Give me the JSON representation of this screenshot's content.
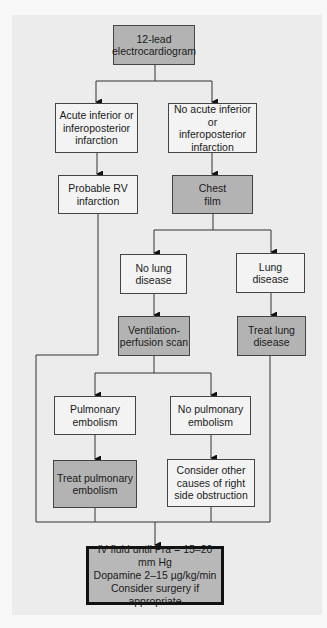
{
  "diagram": {
    "type": "flowchart",
    "colors": {
      "panel": "#ececec",
      "action_box": "#b3b3b3",
      "finding_box": "#f3f3f3",
      "line": "#333333"
    },
    "nodes": {
      "ecg": "12-lead\nelectrocardiogram",
      "acute_inferior": "Acute inferior or\ninferoposterior\ninfarction",
      "no_acute_inferior": "No acute inferior or\ninferoposterior\ninfarction",
      "probable_rv": "Probable RV\ninfarction",
      "chest_film": "Chest\nfilm",
      "no_lung_disease": "No lung\ndisease",
      "lung_disease": "Lung\ndisease",
      "vq_scan": "Ventilation-\nperfusion scan",
      "treat_lung": "Treat lung\ndisease",
      "pe": "Pulmonary\nembolism",
      "no_pe": "No pulmonary\nembolism",
      "treat_pe": "Treat pulmonary\nembolism",
      "other_causes": "Consider other\ncauses of right\nside obstruction",
      "final": "IV fluid until Pra = 15–20 mm Hg\nDopamine 2–15 µg/kg/min\nConsider surgery if appropriate"
    },
    "edges": [
      [
        "ecg",
        "acute_inferior"
      ],
      [
        "ecg",
        "no_acute_inferior"
      ],
      [
        "acute_inferior",
        "probable_rv"
      ],
      [
        "no_acute_inferior",
        "chest_film"
      ],
      [
        "chest_film",
        "no_lung_disease"
      ],
      [
        "chest_film",
        "lung_disease"
      ],
      [
        "no_lung_disease",
        "vq_scan"
      ],
      [
        "lung_disease",
        "treat_lung"
      ],
      [
        "vq_scan",
        "pe"
      ],
      [
        "vq_scan",
        "no_pe"
      ],
      [
        "pe",
        "treat_pe"
      ],
      [
        "no_pe",
        "other_causes"
      ],
      [
        "probable_rv",
        "final"
      ],
      [
        "treat_lung",
        "final"
      ],
      [
        "treat_pe",
        "final"
      ],
      [
        "other_causes",
        "final"
      ]
    ]
  }
}
